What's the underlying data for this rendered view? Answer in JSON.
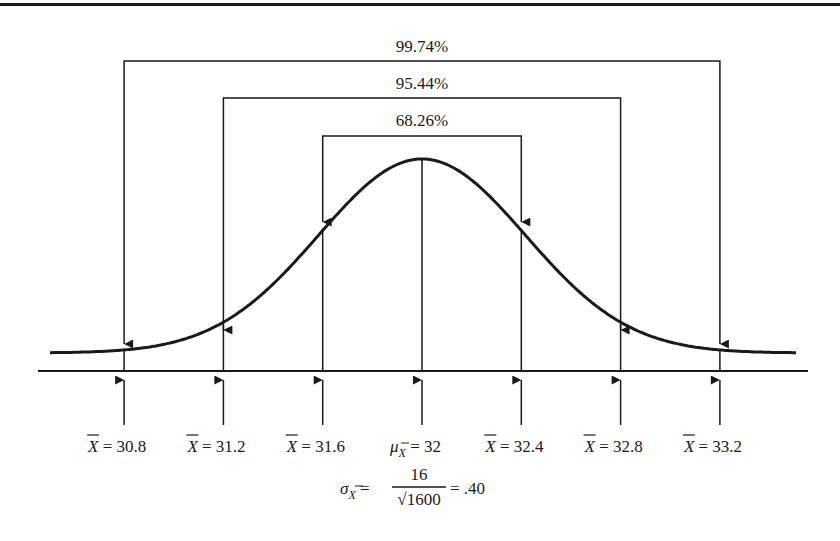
{
  "diagram": {
    "type": "normal-distribution-sampling",
    "mean": 32,
    "std_error": 0.4,
    "brackets": [
      {
        "label": "99.74%",
        "from": "30.8",
        "to": "33.2",
        "sigmas": 3
      },
      {
        "label": "95.44%",
        "from": "31.2",
        "to": "32.8",
        "sigmas": 2
      },
      {
        "label": "68.26%",
        "from": "31.6",
        "to": "32.4",
        "sigmas": 1
      }
    ],
    "axis_labels": [
      {
        "symbol": "X",
        "value": "30.8",
        "text": "= 30.8"
      },
      {
        "symbol": "X",
        "value": "31.2",
        "text": "= 31.2"
      },
      {
        "symbol": "X",
        "value": "31.6",
        "text": "= 31.6"
      },
      {
        "symbol": "μ",
        "subscript": "X",
        "value": "32",
        "text": "= 32"
      },
      {
        "symbol": "X",
        "value": "32.4",
        "text": "= 32.4"
      },
      {
        "symbol": "X",
        "value": "32.8",
        "text": "= 32.8"
      },
      {
        "symbol": "X",
        "value": "33.2",
        "text": "= 33.2"
      }
    ],
    "formula": {
      "lhs_symbol": "σ",
      "lhs_subscript": "X",
      "numerator": "16",
      "denominator": "√1600",
      "result": "= .40"
    }
  }
}
